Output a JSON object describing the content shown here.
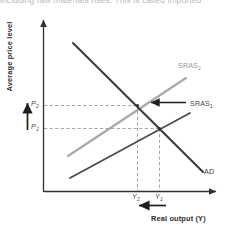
{
  "figure": {
    "truncated_caption": "including raw materials rises. This is called imported",
    "axes": {
      "y_title": "Average price level",
      "x_title": "Real output (Y)"
    },
    "curves": [
      {
        "id": "sras2",
        "label": "SRAS",
        "subscript": "2",
        "color": "#a8a8a8",
        "role": "short-run-aggregate-supply-shifted"
      },
      {
        "id": "sras1",
        "label": "SRAS",
        "subscript": "1",
        "color": "#4a4a4a",
        "role": "short-run-aggregate-supply-initial"
      },
      {
        "id": "ad",
        "label": "AD",
        "subscript": "",
        "color": "#3a3a3a",
        "role": "aggregate-demand"
      }
    ],
    "price_ticks": [
      {
        "id": "p2",
        "label": "P",
        "subscript": "2"
      },
      {
        "id": "p1",
        "label": "P",
        "subscript": "1"
      }
    ],
    "output_ticks": [
      {
        "id": "y2",
        "label": "Y",
        "subscript": "2"
      },
      {
        "id": "y1",
        "label": "Y",
        "subscript": "1"
      }
    ],
    "annotations": [
      {
        "id": "price-rise-arrow",
        "direction": "up",
        "meaning": "price level rises"
      },
      {
        "id": "output-fall-arrow",
        "direction": "left",
        "meaning": "real output falls"
      },
      {
        "id": "sras-shift-arrow",
        "direction": "left",
        "meaning": "SRAS shifts left"
      }
    ],
    "colors": {
      "axis": "#2f2f2f",
      "sras_initial": "#4a4a4a",
      "sras_shifted": "#a8a8a8",
      "ad": "#3a3a3a",
      "dashed": "#9a9aa5",
      "background": "#ffffff"
    }
  }
}
